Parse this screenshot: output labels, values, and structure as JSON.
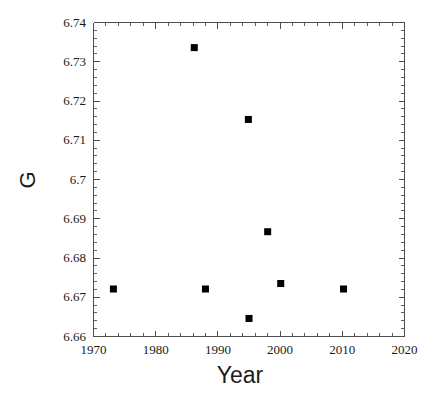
{
  "chart_data": {
    "type": "scatter",
    "title": "",
    "subtitle": "",
    "xlabel": "Year",
    "ylabel": "G",
    "xlim": [
      1970,
      2020
    ],
    "ylim": [
      6.66,
      6.74
    ],
    "grid": false,
    "legend": null,
    "marker": {
      "shape": "square",
      "color": "#000000",
      "size_px": 7
    },
    "x_major_ticks": [
      1970,
      1980,
      1990,
      2000,
      2010,
      2020
    ],
    "x_tick_labels": [
      "1970",
      "1980",
      "1990",
      "2000",
      "2010",
      "2020"
    ],
    "x_minor_interval": 2,
    "y_major_ticks": [
      6.66,
      6.67,
      6.68,
      6.69,
      6.7,
      6.71,
      6.72,
      6.73,
      6.74
    ],
    "y_tick_labels": [
      "6.66",
      "6.67",
      "6.68",
      "6.69",
      "6.7",
      "6.71",
      "6.72",
      "6.73",
      "6.74"
    ],
    "y_minor_interval": 0.002,
    "points": [
      {
        "x": 1973.2,
        "y": 6.6721
      },
      {
        "x": 1986.2,
        "y": 6.7336
      },
      {
        "x": 1988.0,
        "y": 6.6721
      },
      {
        "x": 1994.9,
        "y": 6.7153
      },
      {
        "x": 1995.0,
        "y": 6.6646
      },
      {
        "x": 1998.0,
        "y": 6.6867
      },
      {
        "x": 2000.1,
        "y": 6.6735
      },
      {
        "x": 2010.2,
        "y": 6.6721
      }
    ],
    "axis_color": "#4d4d4d",
    "background_color": "#ffffff"
  }
}
